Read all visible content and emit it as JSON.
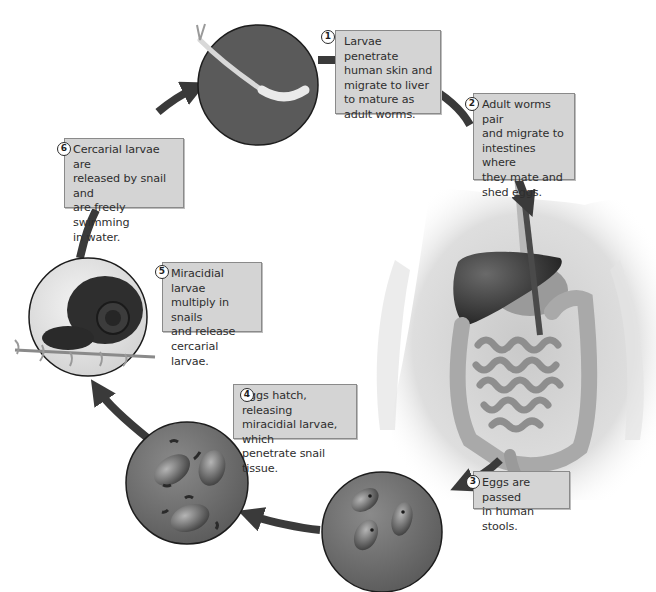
{
  "diagram": {
    "type": "life-cycle",
    "colors": {
      "arrow": "#3a3a3a",
      "label_bg": "#d4d4d4",
      "label_border": "#8a8a8a",
      "circle_fill": "#6e6e6e",
      "circle_border": "#1c1c1c"
    },
    "steps": [
      {
        "number": "1",
        "text": "Larvae penetrate human skin and migrate to liver to mature as adult worms.",
        "image": "cercaria-larva-circle"
      },
      {
        "number": "2",
        "text": "Adult worms pair and migrate to intestines where they mate and shed eggs.",
        "image": "human-abdomen-organs"
      },
      {
        "number": "3",
        "text": "Eggs are passed in human stools.",
        "image": "eggs-circle"
      },
      {
        "number": "4",
        "text": "Eggs hatch, releasing miracidial larvae, which penetrate snail tissue.",
        "image": "miracidia-circle"
      },
      {
        "number": "5",
        "text": "Miracidial larvae multiply in snails and release cercarial larvae.",
        "image": "snail-circle"
      },
      {
        "number": "6",
        "text": "Cercarial larvae are released by snail and are freely swimming in water.",
        "image": null
      }
    ],
    "labels": {
      "step1_lines": [
        "Larvae penetrate",
        "human skin and",
        "migrate to liver",
        "to mature as",
        "adult worms."
      ],
      "step2_lines": [
        "Adult worms pair",
        "and migrate to",
        "intestines where",
        "they mate and",
        "shed eggs."
      ],
      "step3_lines": [
        "Eggs are passed",
        "in human stools."
      ],
      "step4_lines": [
        "Eggs hatch, releasing",
        "miracidial larvae, which",
        "penetrate snail tissue."
      ],
      "step5_lines": [
        "Miracidial larvae",
        "multiply in snails",
        "and release",
        "cercarial larvae."
      ],
      "step6_lines": [
        "Cercarial larvae are",
        "released by snail and",
        "are freely swimming",
        "in water."
      ]
    }
  }
}
